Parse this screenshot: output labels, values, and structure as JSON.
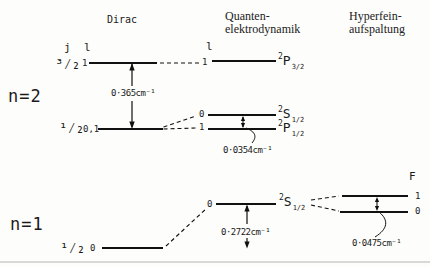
{
  "figure": {
    "headers": {
      "dirac": "Dirac",
      "qed": [
        "Quanten-",
        "elektrodynamik"
      ],
      "hyperfine": [
        "Hyperfein-",
        "aufspaltung"
      ]
    },
    "axis_labels": {
      "j": "j",
      "l_dirac": "l",
      "l_qed": "l",
      "f": "F"
    },
    "n2": {
      "label": "n=2",
      "j_32": "³⁄₂",
      "j_12": "¹⁄₂",
      "dirac_l_top": "1",
      "dirac_l_bottom": "0,1",
      "qed_l_top": "1",
      "qed_l_s": "0",
      "qed_l_p": "1",
      "fine_structure_splitting": "0·365cm⁻¹",
      "lamb_shift_splitting": "0·0354cm⁻¹",
      "term_p32": {
        "sup": "2",
        "letter": "P",
        "sub": "3/2"
      },
      "term_s12": {
        "sup": "2",
        "letter": "S",
        "sub": "1/2"
      },
      "term_p12": {
        "sup": "2",
        "letter": "P",
        "sub": "1/2"
      }
    },
    "n1": {
      "label": "n=1",
      "j_12": "¹⁄₂",
      "dirac_l": "0",
      "qed_l": "0",
      "lamb_shift": "0·2722cm⁻¹",
      "hyperfine_splitting": "0·0475cm⁻¹",
      "term_s12": {
        "sup": "2",
        "letter": "S",
        "sub": "1/2"
      },
      "f_upper": "1",
      "f_lower": "0"
    }
  }
}
